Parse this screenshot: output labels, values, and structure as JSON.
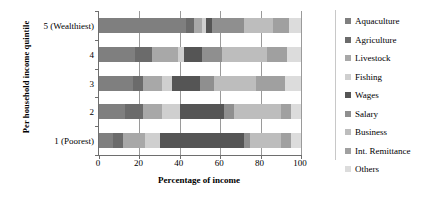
{
  "chart_data": {
    "type": "bar",
    "orientation": "horizontal",
    "stacked": true,
    "title": "",
    "xlabel": "Percentage of income",
    "ylabel": "Per household income quintile",
    "xlim": [
      0,
      100
    ],
    "xticks": [
      0,
      20,
      40,
      60,
      80,
      100
    ],
    "grid": true,
    "legend_position": "right",
    "categories": [
      "5 (Wealthiest)",
      "4",
      "3",
      "2",
      "1 (Poorest)"
    ],
    "series": [
      {
        "name": "Aquaculture",
        "color": "#7f7f7f",
        "values": [
          43,
          18,
          17,
          13,
          7
        ]
      },
      {
        "name": "Agriculture",
        "color": "#6b6b6b",
        "values": [
          4,
          8,
          5,
          9,
          5
        ]
      },
      {
        "name": "Livestock",
        "color": "#a8a8a8",
        "values": [
          4,
          13,
          9,
          9,
          11
        ]
      },
      {
        "name": "Fishing",
        "color": "#cfcfcf",
        "values": [
          2,
          3,
          5,
          9,
          7
        ]
      },
      {
        "name": "Wages",
        "color": "#555555",
        "values": [
          3,
          9,
          14,
          22,
          42
        ]
      },
      {
        "name": "Salary",
        "color": "#8f8f8f",
        "values": [
          16,
          10,
          7,
          5,
          3
        ]
      },
      {
        "name": "Business",
        "color": "#bdbdbd",
        "values": [
          14,
          22,
          21,
          23,
          15
        ]
      },
      {
        "name": "Int. Remittance",
        "color": "#a0a0a0",
        "values": [
          8,
          10,
          14,
          5,
          5
        ]
      },
      {
        "name": "Others",
        "color": "#dcdcdc",
        "values": [
          6,
          7,
          8,
          5,
          5
        ]
      }
    ]
  },
  "axis": {
    "y_title": "Per household income quintile",
    "x_title": "Percentage of income",
    "x_ticks": [
      "0",
      "20",
      "40",
      "60",
      "80",
      "100"
    ],
    "y_ticks": [
      "5 (Wealthiest)",
      "4",
      "3",
      "2",
      "1 (Poorest)"
    ]
  },
  "legend": {
    "items": [
      {
        "label": "Aquaculture"
      },
      {
        "label": "Agriculture"
      },
      {
        "label": "Livestock"
      },
      {
        "label": "Fishing"
      },
      {
        "label": "Wages"
      },
      {
        "label": "Salary"
      },
      {
        "label": "Business"
      },
      {
        "label": "Int. Remittance"
      },
      {
        "label": "Others"
      }
    ]
  }
}
